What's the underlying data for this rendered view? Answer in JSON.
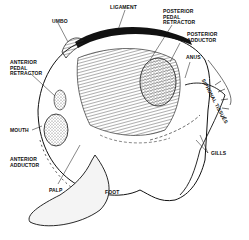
{
  "diagram": {
    "labels": {
      "ligament": "LIGAMENT",
      "umbo": "UMBO",
      "posterior_pedal_retractor": "POSTERIOR\nPEDAL\nRETRACTOR",
      "posterior_adductor": "POSTERIOR\nADDUCTOR",
      "anus": "ANUS",
      "siphonal_tissues": "SIPHONAL TISSUES",
      "anterior_pedal_retractor": "ANTERIOR\nPEDAL\nRETRACTOR",
      "mouth": "MOUTH",
      "anterior_adductor": "ANTERIOR\nADDUCTOR",
      "gills": "GILLS",
      "palp": "PALP",
      "foot": "FOOT"
    }
  }
}
